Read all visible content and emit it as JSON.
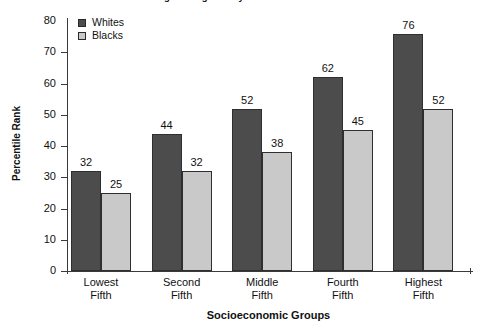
{
  "chart_data": {
    "type": "bar",
    "title": "2. Mathematics Skills on Entering Kindergarten by Race and Socioeconomic Status",
    "xlabel": "Socioeconomic Groups",
    "ylabel": "Percentile Rank",
    "categories": [
      "Lowest Fifth",
      "Second Fifth",
      "Middle Fifth",
      "Fourth Fifth",
      "Highest Fifth"
    ],
    "category_lines": [
      [
        "Lowest",
        "Fifth"
      ],
      [
        "Second",
        "Fifth"
      ],
      [
        "Middle",
        "Fifth"
      ],
      [
        "Fourth",
        "Fifth"
      ],
      [
        "Highest",
        "Fifth"
      ]
    ],
    "series": [
      {
        "name": "Whites",
        "color": "#4c4c4c",
        "values": [
          32,
          44,
          52,
          62,
          76
        ]
      },
      {
        "name": "Blacks",
        "color": "#c9c9c9",
        "values": [
          25,
          32,
          38,
          45,
          52
        ]
      }
    ],
    "ylim": [
      0,
      80
    ],
    "yticks": [
      80,
      70,
      60,
      50,
      40,
      30,
      20,
      10,
      0
    ],
    "grid": false,
    "legend_position": "top-left"
  }
}
